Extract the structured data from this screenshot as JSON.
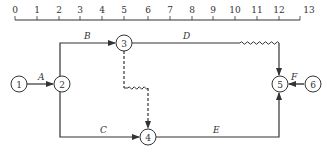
{
  "diagram": {
    "type": "time-scaled network (double-code) diagram",
    "colors": {
      "line": "#333333",
      "background": "#ffffff"
    },
    "timeline": {
      "ticks": [
        "0",
        "1",
        "2",
        "3",
        "4",
        "5",
        "6",
        "7",
        "8",
        "9",
        "10",
        "11",
        "12",
        "13"
      ],
      "tick_x": [
        15,
        37,
        59,
        80,
        102,
        124,
        148,
        170,
        192,
        213,
        235,
        257,
        279,
        300
      ],
      "y": 20
    },
    "nodes": [
      {
        "id": "1",
        "label": "1",
        "x": 19,
        "y": 84
      },
      {
        "id": "2",
        "label": "2",
        "x": 62,
        "y": 84
      },
      {
        "id": "3",
        "label": "3",
        "x": 124,
        "y": 43
      },
      {
        "id": "4",
        "label": "4",
        "x": 148,
        "y": 137
      },
      {
        "id": "5",
        "label": "5",
        "x": 280,
        "y": 84
      },
      {
        "id": "6",
        "label": "6",
        "x": 312,
        "y": 84
      }
    ],
    "activities": [
      {
        "id": "A",
        "label": "A",
        "from": "1",
        "to": "2",
        "style": "solid"
      },
      {
        "id": "B",
        "label": "B",
        "from": "2",
        "to": "3",
        "style": "solid"
      },
      {
        "id": "C",
        "label": "C",
        "from": "2",
        "to": "4",
        "style": "solid"
      },
      {
        "id": "D",
        "label": "D",
        "from": "3",
        "to": "5",
        "style": "solid+wavy (free float)"
      },
      {
        "id": "dummy",
        "label": "",
        "from": "3",
        "to": "4",
        "style": "dashed+wavy (dummy)"
      },
      {
        "id": "E",
        "label": "E",
        "from": "4",
        "to": "5",
        "style": "solid"
      },
      {
        "id": "F",
        "label": "F",
        "from": "6",
        "to": "5",
        "style": "solid"
      }
    ]
  }
}
